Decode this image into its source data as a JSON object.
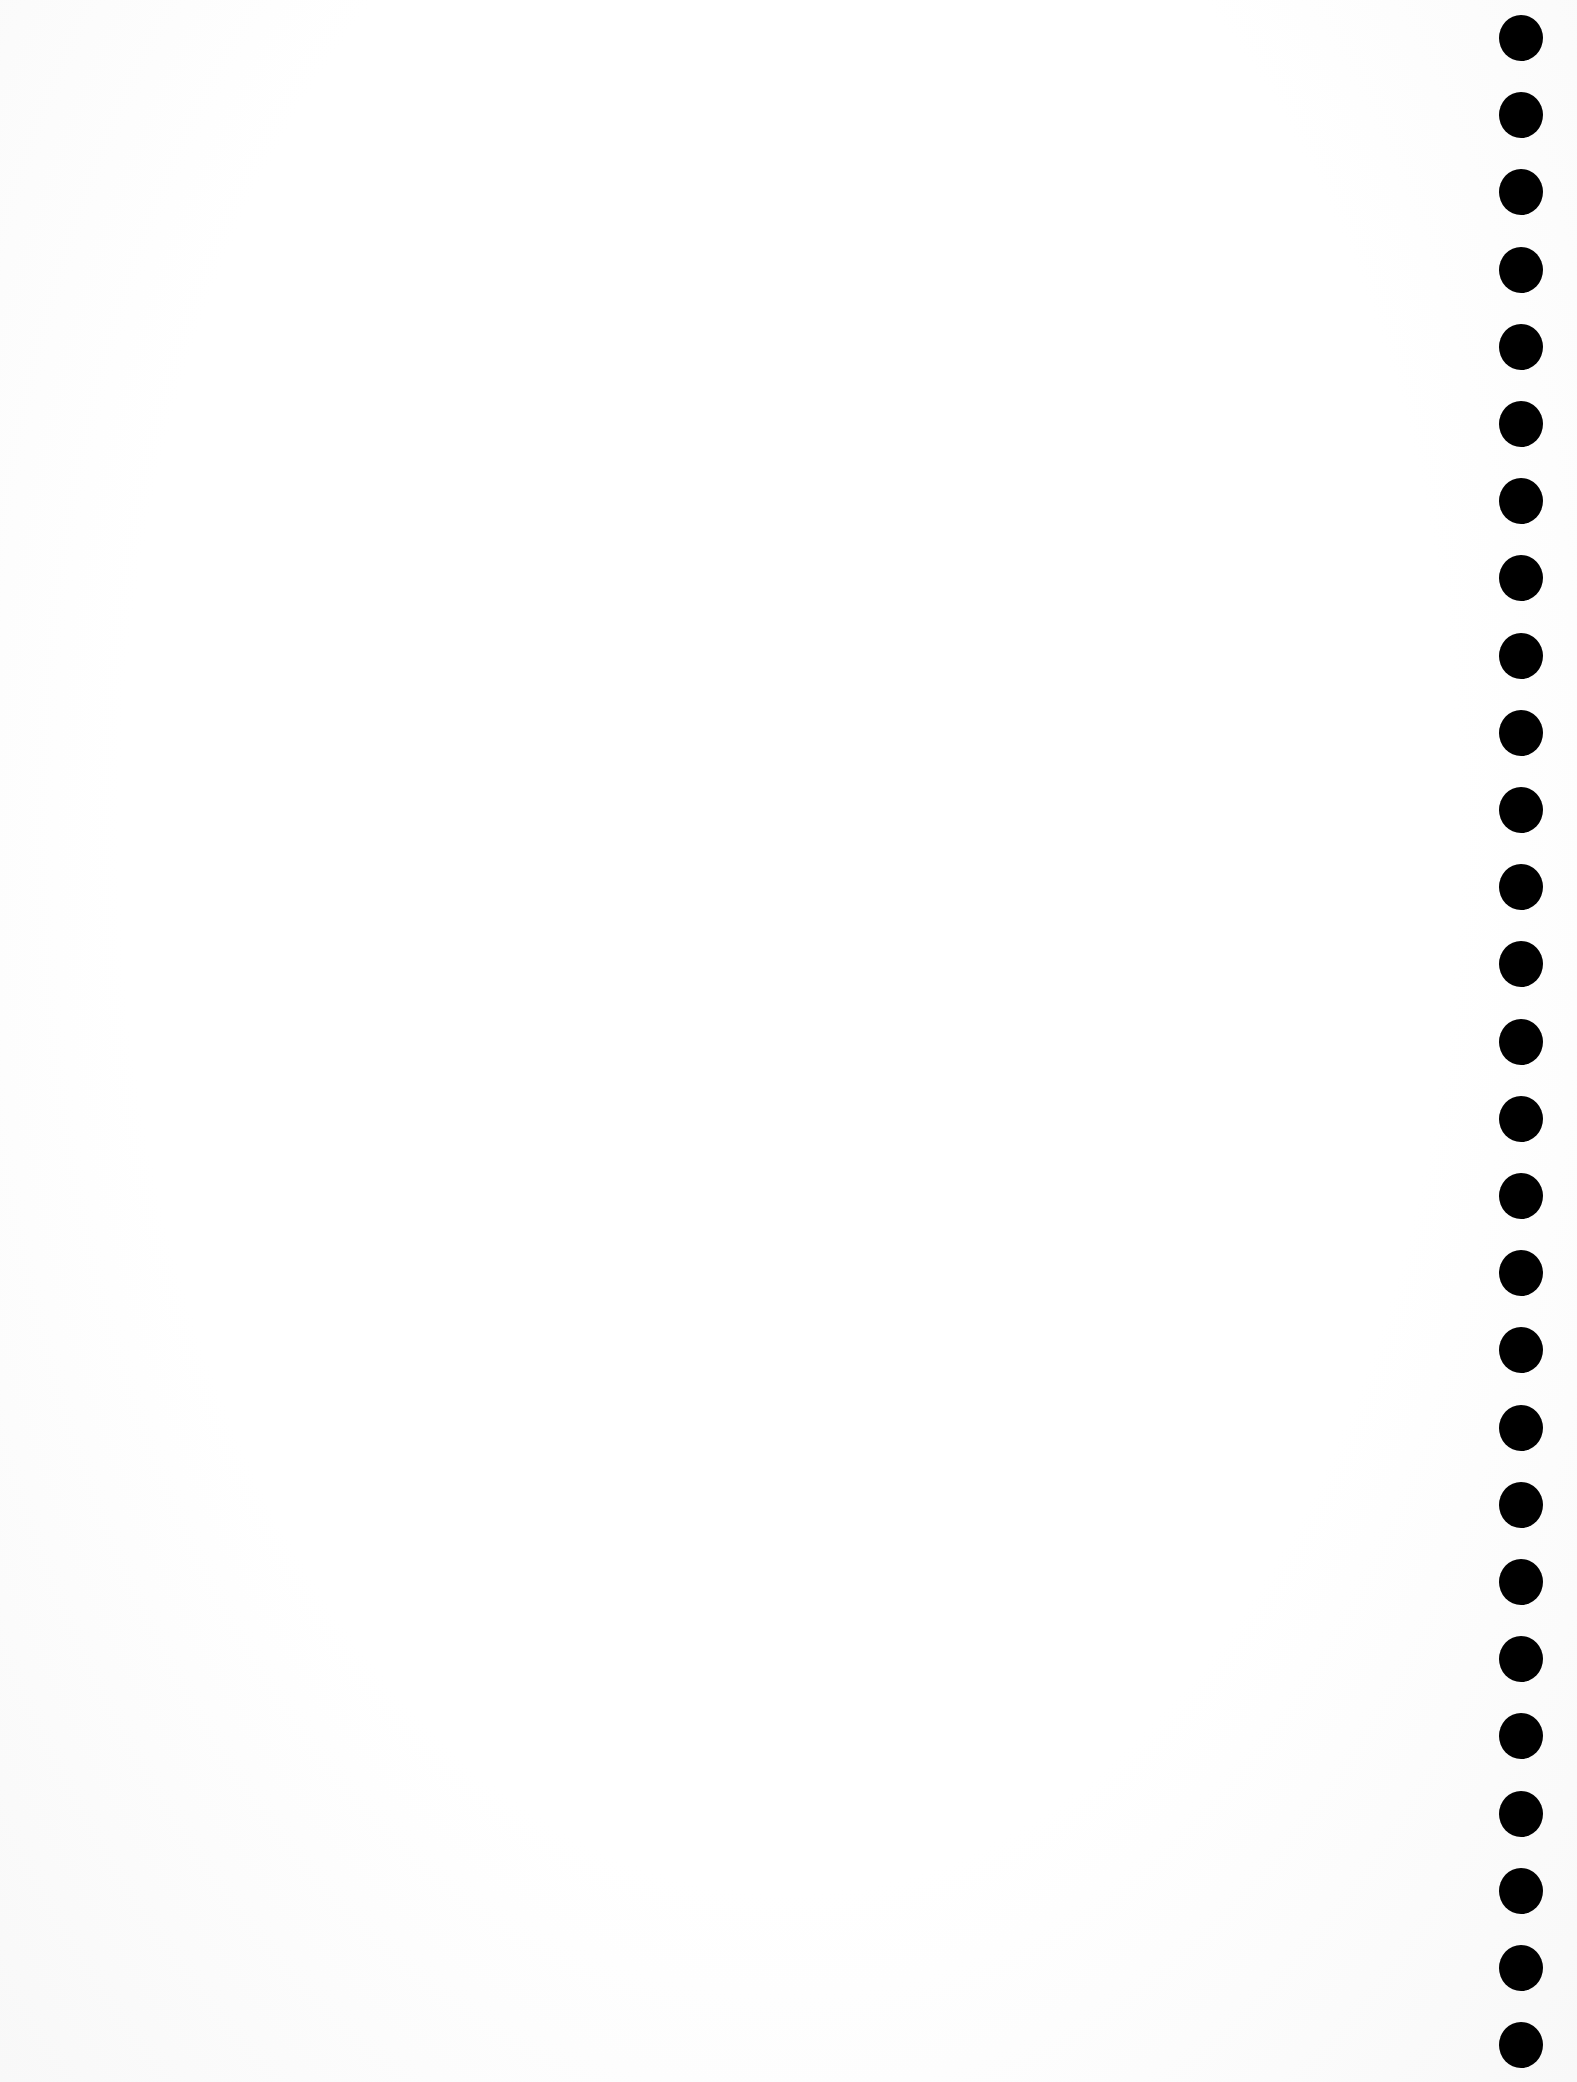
{
  "page": {
    "type": "blank notebook page",
    "background_color": "#ffffff",
    "content": ""
  },
  "binding": {
    "side": "right",
    "hole_count": 27,
    "hole_color": "#000000",
    "first_hole_y": 38,
    "hole_spacing": 77.2
  }
}
